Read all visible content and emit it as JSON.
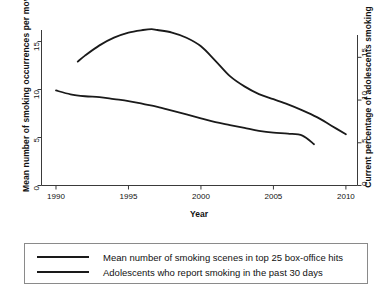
{
  "chart_data": {
    "type": "line",
    "title": "",
    "xlabel": "Year",
    "ylabel": "Mean number of  smoking occurrences per movie",
    "y2label": "Current percentage of adolescents smoking",
    "xlim": [
      1989,
      2010.8
    ],
    "xticks": [
      1990,
      1995,
      2000,
      2005,
      2010
    ],
    "xtick_labels": [
      "1990",
      "1995",
      "2000",
      "2005",
      "2010"
    ],
    "ylim": [
      0,
      16.2
    ],
    "yticks": [
      0,
      5,
      10,
      15
    ],
    "ytick_labels": [
      "0",
      "5",
      "10",
      "15"
    ],
    "y2lim": [
      0,
      18.2
    ],
    "y2ticks": [
      0,
      5,
      10,
      15
    ],
    "y2tick_labels": [
      "0",
      "5",
      "10",
      "15"
    ],
    "grid": false,
    "legend_position": "below-plot",
    "series": [
      {
        "name": "Mean number of smoking scenes in top 25 box-office hits",
        "axis": "left",
        "color": "#1a1a1a",
        "x": [
          1990.0,
          1991.0,
          1992.0,
          1993.0,
          1994.0,
          1995.0,
          1996.0,
          1997.0,
          1998.0,
          1999.0,
          2000.0,
          2001.0,
          2002.0,
          2003.0,
          2004.0,
          2005.0,
          2006.0,
          2007.0,
          2007.8
        ],
        "values": [
          9.9,
          9.5,
          9.3,
          9.2,
          9.0,
          8.8,
          8.5,
          8.2,
          7.8,
          7.4,
          7.0,
          6.6,
          6.3,
          6.0,
          5.7,
          5.5,
          5.4,
          5.2,
          4.3
        ]
      },
      {
        "name": "Adolescents who report smoking in the past 30 days",
        "axis": "right",
        "color": "#1a1a1a",
        "x": [
          1991.5,
          1992.0,
          1993.0,
          1994.0,
          1995.0,
          1996.0,
          1996.6,
          1997.0,
          1998.0,
          1999.0,
          2000.0,
          2001.0,
          2002.0,
          2003.0,
          2004.0,
          2005.0,
          2006.0,
          2007.0,
          2008.0,
          2009.0,
          2010.0
        ],
        "values": [
          14.5,
          15.2,
          16.4,
          17.3,
          17.9,
          18.2,
          18.3,
          18.2,
          17.9,
          17.3,
          16.3,
          14.6,
          12.8,
          11.6,
          10.7,
          10.1,
          9.5,
          8.8,
          8.0,
          7.0,
          6.0
        ]
      }
    ]
  },
  "legend": {
    "entries": [
      {
        "label": "Mean number of smoking scenes in top 25 box-office hits"
      },
      {
        "label": "Adolescents who report smoking in the past 30 days"
      }
    ]
  }
}
